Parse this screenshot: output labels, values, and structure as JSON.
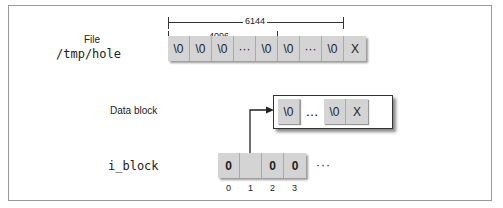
{
  "file_section": {
    "label_line1": "File",
    "label_line2": "/tmp/hole",
    "cells": [
      "\\0",
      "\\0",
      "\\0",
      "···",
      "\\0",
      "\\0",
      "···",
      "\\0",
      "X"
    ],
    "dimension_outer": "6144",
    "dimension_inner": "4096"
  },
  "data_block_section": {
    "label": "Data block",
    "cells": [
      "\\0",
      "…",
      "\\0",
      "X"
    ]
  },
  "i_block_section": {
    "label": "i_block",
    "cells": [
      "0",
      "",
      "0",
      "0"
    ],
    "trailing": "···",
    "indices": [
      "0",
      "1",
      "2",
      "3"
    ]
  },
  "colors": {
    "cell_fill": "#d4d4d4",
    "line": "#333333",
    "frame": "#9a9a9a"
  }
}
